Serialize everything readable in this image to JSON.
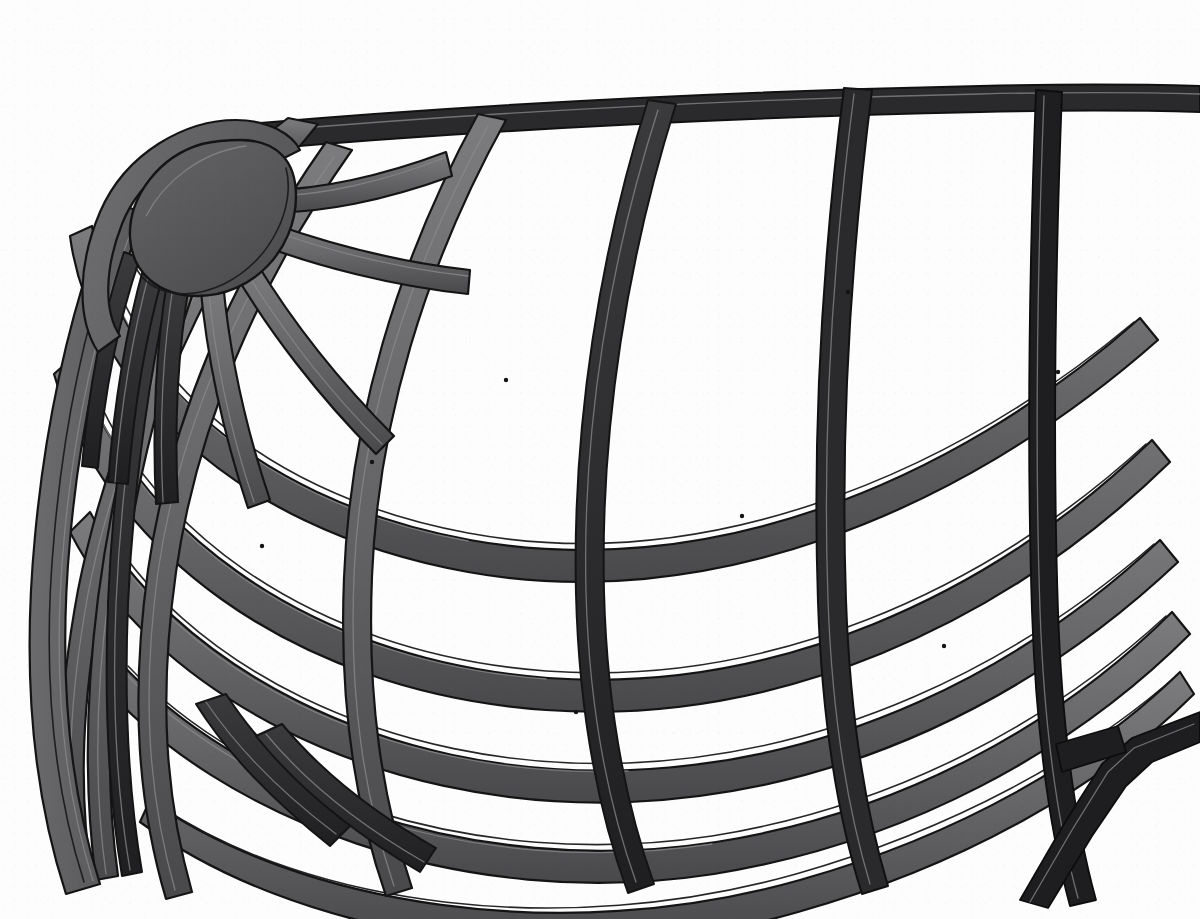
{
  "figure": {
    "view": "perspective cutaway of upper dome quadrant",
    "caption": "",
    "label": "",
    "background_color": "#fdfdfd",
    "canvas": {
      "width": 1200,
      "height": 919
    }
  },
  "style": {
    "background": "#fdfdfd",
    "outline": "#141414",
    "strut_top_face": "#6e6e70",
    "strut_side_face": "#4a4a4c",
    "strut_dark_face": "#262628",
    "strut_edge_dark": "#1b1b1d",
    "hub_fill": "#58585a",
    "hub_rim": "#6d6d6f",
    "rim_band_light": "#7a7a7c",
    "rim_band_dark": "#313133",
    "outline_width": 2.2
  },
  "geometry": {
    "apex_hub": {
      "name": "apex-hub-cap",
      "center_x": 196,
      "center_y": 208,
      "radius": 78,
      "shape": "half-disk",
      "fill": "#58585a"
    },
    "meridian_count": 9,
    "latitude_count": 5,
    "cell_count_visible": 28,
    "strut_width_px": 16,
    "strut_depth_px": 7,
    "notes": "Meridional ribs radiate from the apex hub; latitude hoops cross them forming quadrilateral cells that foreshorten toward the silhouette edges."
  },
  "chart_data": {
    "type": "diagram",
    "xlabel": "",
    "ylabel": "",
    "elements": [
      {
        "name": "apex-hub-cap",
        "kind": "hub",
        "x": 196,
        "y": 208
      },
      {
        "name": "meridian-rib-1",
        "kind": "meridian"
      },
      {
        "name": "meridian-rib-2",
        "kind": "meridian"
      },
      {
        "name": "meridian-rib-3",
        "kind": "meridian"
      },
      {
        "name": "meridian-rib-4",
        "kind": "meridian"
      },
      {
        "name": "meridian-rib-5",
        "kind": "meridian"
      },
      {
        "name": "meridian-rib-6",
        "kind": "meridian"
      },
      {
        "name": "meridian-rib-7",
        "kind": "meridian"
      },
      {
        "name": "meridian-rib-8",
        "kind": "meridian"
      },
      {
        "name": "meridian-rib-9",
        "kind": "meridian"
      },
      {
        "name": "latitude-hoop-1",
        "kind": "latitude"
      },
      {
        "name": "latitude-hoop-2",
        "kind": "latitude"
      },
      {
        "name": "latitude-hoop-3",
        "kind": "latitude"
      },
      {
        "name": "latitude-hoop-4",
        "kind": "latitude"
      },
      {
        "name": "latitude-hoop-5",
        "kind": "latitude"
      },
      {
        "name": "silhouette-rim",
        "kind": "rim"
      }
    ]
  }
}
